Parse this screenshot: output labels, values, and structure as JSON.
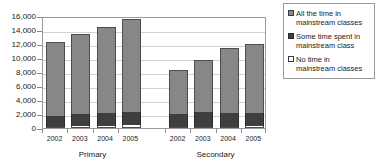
{
  "chart_data": {
    "type": "bar",
    "stacked": true,
    "title": "",
    "subtitle": "",
    "xlabel": "",
    "ylabel": "",
    "ylim": [
      0,
      16000
    ],
    "ytick_labels": [
      "16,000",
      "14,000",
      "12,000",
      "10,000",
      "8,000",
      "6,000",
      "4,000",
      "2,000",
      "0"
    ],
    "ytick_values": [
      16000,
      14000,
      12000,
      10000,
      8000,
      6000,
      4000,
      2000,
      0
    ],
    "grid": true,
    "legend_position": "right",
    "groups": [
      {
        "name": "Primary",
        "categories": [
          "2002",
          "2003",
          "2004",
          "2005"
        ]
      },
      {
        "name": "Secondary",
        "categories": [
          "2002",
          "2003",
          "2004",
          "2005"
        ]
      }
    ],
    "categories": [
      "2002",
      "2003",
      "2004",
      "2005",
      "2002",
      "2003",
      "2004",
      "2005"
    ],
    "series": [
      {
        "name": "No time in mainstream classes",
        "color": "#ffffff",
        "values": [
          200,
          250,
          300,
          450,
          150,
          200,
          200,
          250
        ]
      },
      {
        "name": "Some time spent in mainstream class",
        "color": "#3f3f3f",
        "values": [
          1550,
          1800,
          1800,
          1900,
          1850,
          2100,
          1900,
          1950
        ]
      },
      {
        "name": "All the time in mainstream classes",
        "color": "#878787",
        "values": [
          10500,
          11450,
          12400,
          13250,
          6250,
          7400,
          9400,
          9800
        ]
      }
    ],
    "totals": [
      12250,
      13500,
      14500,
      15600,
      8250,
      9700,
      11500,
      12000
    ]
  },
  "legend": {
    "items": [
      {
        "label": "All the time in mainstream classes",
        "swatch": "swatch-medium-gray"
      },
      {
        "label": "Some time spent in mainstream class",
        "swatch": "swatch-dark-gray"
      },
      {
        "label": "No time in mainstream classes",
        "swatch": "swatch-white"
      }
    ]
  },
  "colors": {
    "all_the_time": "#878787",
    "some_time": "#3f3f3f",
    "no_time": "#ffffff",
    "gridline": "#d2d2d2",
    "axis": "#9a9a9a",
    "text": "#1a1a1a"
  }
}
